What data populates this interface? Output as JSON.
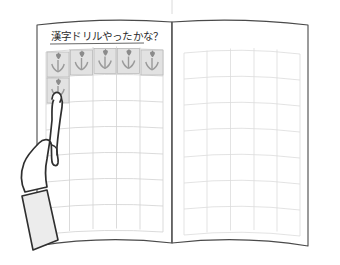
{
  "illustration": {
    "kind": "line-drawing",
    "subject": "open-notebook-with-reward-sticker-chart-and-pointing-hand",
    "background_color": "#ffffff",
    "ink_color": "#3a3a3a",
    "line_color_faint": "#c9c9c9"
  },
  "notebook": {
    "name": "open-notebook",
    "outline_color": "#4a4a4a",
    "page_color": "#ffffff",
    "spine_label": "center-binding",
    "left_page": {
      "name": "left-page",
      "title": "漢字ドリルやったかな？",
      "title_underline": true,
      "grid": {
        "columns": 5,
        "rows": 7,
        "line_color": "#d2d2d2"
      }
    },
    "right_page": {
      "name": "right-page",
      "title": "",
      "grid": {
        "columns": 5,
        "rows": 7,
        "line_color": "#dcdcdc"
      }
    }
  },
  "stickers": {
    "name": "tulip-reward-stickers",
    "glyph": "tulip",
    "tile_fill": "#e2e2e2",
    "tile_stroke": "#b4b4b4",
    "flower_color": "#8e8e8e",
    "stem_color": "#9a9a9a",
    "top_row_count": 5,
    "second_row_count": 1,
    "total_count": 6,
    "top_row_positions": [
      1,
      2,
      3,
      4,
      5
    ],
    "second_row_positions": [
      1
    ]
  },
  "hand": {
    "name": "pointing-hand",
    "gesture": "index-finger-pointing-up",
    "outline_color": "#2f2f2f",
    "skin_fill": "#ffffff",
    "sleeve_fill": "#ececec",
    "sleeve_stroke": "#2f2f2f",
    "points_at": "second-row-first-sticker"
  },
  "guides": {
    "top_tick_color": "#dadada"
  }
}
